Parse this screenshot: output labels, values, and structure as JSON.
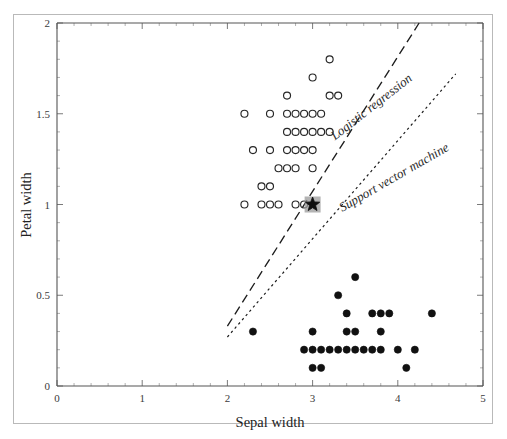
{
  "chart_data": {
    "type": "scatter",
    "title": "",
    "xlabel": "Sepal width",
    "ylabel": "Petal width",
    "xlim": [
      0,
      5
    ],
    "ylim": [
      0,
      2
    ],
    "xticks": [
      0,
      1,
      2,
      3,
      4,
      5
    ],
    "xtick_labels": [
      "0",
      "1",
      "2",
      "3",
      "4",
      "5"
    ],
    "yticks": [
      0,
      0.5,
      1,
      1.5,
      2
    ],
    "ytick_labels": [
      "0",
      "0.5",
      "1",
      "1.5",
      "2"
    ],
    "grid": false,
    "legend_position": "inline-annotations",
    "series": [
      {
        "name": "Iris versicolor",
        "marker": "open-circle",
        "color": "#262626",
        "points": [
          [
            2.2,
            1.5
          ],
          [
            2.5,
            1.5
          ],
          [
            2.7,
            1.5
          ],
          [
            2.8,
            1.5
          ],
          [
            2.9,
            1.5
          ],
          [
            3.0,
            1.5
          ],
          [
            3.1,
            1.5
          ],
          [
            2.7,
            1.6
          ],
          [
            3.2,
            1.6
          ],
          [
            3.3,
            1.6
          ],
          [
            3.0,
            1.7
          ],
          [
            3.2,
            1.8
          ],
          [
            2.7,
            1.4
          ],
          [
            2.8,
            1.4
          ],
          [
            2.9,
            1.4
          ],
          [
            3.0,
            1.4
          ],
          [
            3.1,
            1.4
          ],
          [
            3.2,
            1.4
          ],
          [
            2.3,
            1.3
          ],
          [
            2.5,
            1.3
          ],
          [
            2.7,
            1.3
          ],
          [
            2.8,
            1.3
          ],
          [
            2.9,
            1.3
          ],
          [
            3.0,
            1.3
          ],
          [
            2.6,
            1.2
          ],
          [
            2.7,
            1.2
          ],
          [
            2.8,
            1.2
          ],
          [
            3.0,
            1.2
          ],
          [
            2.4,
            1.1
          ],
          [
            2.5,
            1.1
          ],
          [
            2.2,
            1.0
          ],
          [
            2.4,
            1.0
          ],
          [
            2.5,
            1.0
          ],
          [
            2.6,
            1.0
          ],
          [
            2.8,
            1.0
          ],
          [
            2.9,
            1.0
          ]
        ]
      },
      {
        "name": "Iris setosa",
        "marker": "filled-circle",
        "color": "#111111",
        "points": [
          [
            3.5,
            0.6
          ],
          [
            3.3,
            0.5
          ],
          [
            3.4,
            0.4
          ],
          [
            3.7,
            0.4
          ],
          [
            3.8,
            0.4
          ],
          [
            3.9,
            0.4
          ],
          [
            4.4,
            0.4
          ],
          [
            2.3,
            0.3
          ],
          [
            3.0,
            0.3
          ],
          [
            3.4,
            0.3
          ],
          [
            3.5,
            0.3
          ],
          [
            3.8,
            0.3
          ],
          [
            2.9,
            0.2
          ],
          [
            3.0,
            0.2
          ],
          [
            3.1,
            0.2
          ],
          [
            3.2,
            0.2
          ],
          [
            3.3,
            0.2
          ],
          [
            3.4,
            0.2
          ],
          [
            3.5,
            0.2
          ],
          [
            3.6,
            0.2
          ],
          [
            3.7,
            0.2
          ],
          [
            3.8,
            0.2
          ],
          [
            4.0,
            0.2
          ],
          [
            4.2,
            0.2
          ],
          [
            3.0,
            0.1
          ],
          [
            3.1,
            0.1
          ],
          [
            4.1,
            0.1
          ]
        ]
      },
      {
        "name": "Query point",
        "marker": "star",
        "color": "#101010",
        "halo_color": "#9a9a9a",
        "points": [
          [
            3.0,
            1.0
          ]
        ]
      }
    ],
    "boundaries": [
      {
        "name": "Logistic regression",
        "label": "Logistic regression",
        "style": "dashed",
        "color": "#1d1d1d",
        "x0": 2.0,
        "y0": 0.33,
        "x1": 4.25,
        "y1": 2.0
      },
      {
        "name": "Support vector machine",
        "label": "Support vector machine",
        "style": "dotted",
        "color": "#1d1d1d",
        "x0": 2.0,
        "y0": 0.27,
        "x1": 4.68,
        "y1": 1.72
      }
    ],
    "annotations": [
      {
        "text": "Logistic regression",
        "x": 3.72,
        "y": 1.52,
        "rotation": -38
      },
      {
        "text": "Support vector machine",
        "x": 3.98,
        "y": 1.13,
        "rotation": -30
      }
    ]
  },
  "axes": {
    "x_title": "Sepal width",
    "y_title": "Petal width"
  }
}
